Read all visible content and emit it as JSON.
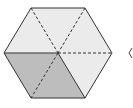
{
  "diagram": {
    "shape": "regular hexagon divided into 6 triangles",
    "triangles_total": 6,
    "triangles_shaded": 2,
    "colors": {
      "light_fill": "#ebebeb",
      "dark_fill": "#bdbdbd",
      "outline": "#333333",
      "dashed": "#333333"
    }
  }
}
